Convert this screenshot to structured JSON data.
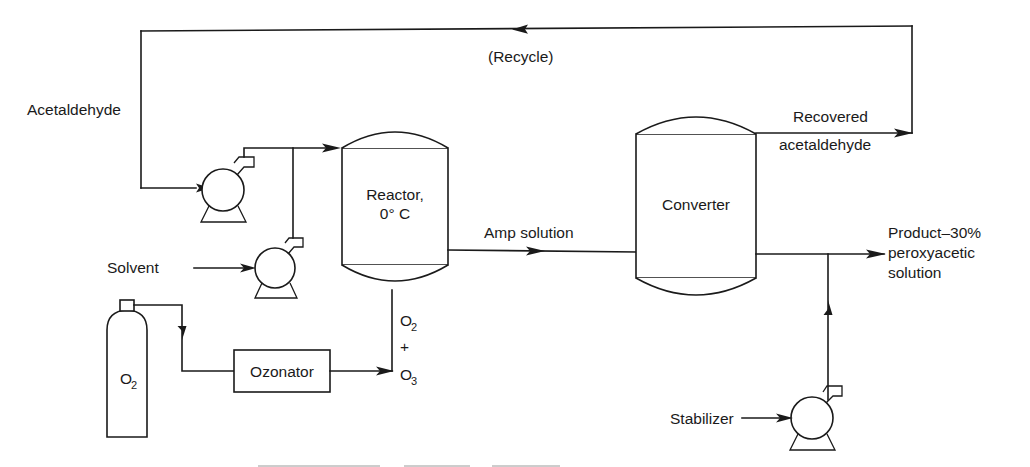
{
  "diagram": {
    "background_color": "#ffffff",
    "line_color": "#1a1a1a",
    "width": 1030,
    "height": 467
  },
  "streams": {
    "recycle": "(Recycle)",
    "feed_acetaldehyde": "Acetaldehyde",
    "feed_solvent": "Solvent",
    "amp_solution": "Amp solution",
    "recovered_line1": "Recovered",
    "recovered_line2": "acetaldehyde",
    "product_line1": "Product–30%",
    "product_line2": "peroxyacetic",
    "product_line3": "solution",
    "feed_stabilizer": "Stabilizer",
    "ozone_mix_top": "O",
    "ozone_mix_top_sub": "2",
    "ozone_mix_plus": "+",
    "ozone_mix_bottom": "O",
    "ozone_mix_bottom_sub": "3"
  },
  "equipment": {
    "reactor_line1": "Reactor,",
    "reactor_line2": "0° C",
    "converter": "Converter",
    "ozonator": "Ozonator",
    "oxygen_cylinder": "O",
    "oxygen_cylinder_sub": "2"
  },
  "icons": {
    "pump_acetaldehyde": "centrifugal-pump-icon",
    "pump_solvent": "centrifugal-pump-icon",
    "pump_stabilizer": "centrifugal-pump-icon",
    "vessel_reactor": "pressure-vessel-icon",
    "vessel_converter": "pressure-vessel-icon",
    "gas_cylinder": "gas-cylinder-icon",
    "ozonator_box": "process-box-icon"
  }
}
